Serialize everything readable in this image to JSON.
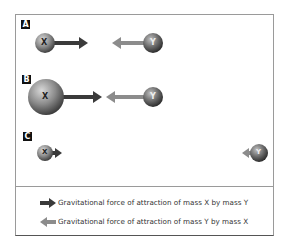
{
  "panels": [
    {
      "label": "A",
      "mass_x": "X",
      "mass_y": "Y"
    },
    {
      "label": "B",
      "mass_x": "X",
      "mass_y": "Y"
    },
    {
      "label": "C",
      "mass_x": "X",
      "mass_y": "Y"
    }
  ],
  "legend": [
    {
      "icon": "dark-arrow-right-icon",
      "text": "Gravitational force of attraction of mass X by mass Y",
      "color": "#3a3a3a"
    },
    {
      "icon": "light-arrow-left-icon",
      "text": "Gravitational force of attraction of mass Y by mass X",
      "color": "#8c8c8c"
    }
  ]
}
